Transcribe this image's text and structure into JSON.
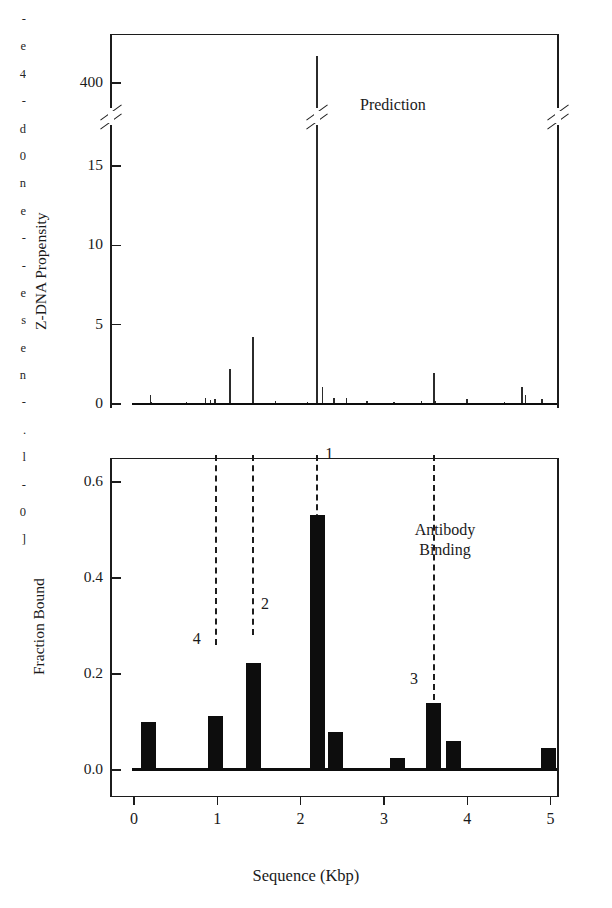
{
  "margin_text_fragments": [
    "-",
    "e",
    "4",
    "-",
    "d",
    "0",
    "n",
    "e",
    "-",
    "-",
    "e",
    "s",
    "e",
    "n",
    "-",
    ".",
    "l",
    "-",
    "0",
    "]"
  ],
  "figure": {
    "top_panel": {
      "annotation": "Prediction",
      "ylabel": "Z-DNA Propensity",
      "ytick_labels": [
        "0",
        "5",
        "10",
        "15",
        "400"
      ]
    },
    "bottom_panel": {
      "annotation_line1": "Antibody",
      "annotation_line2": "Binding",
      "ylabel": "Fraction Bound",
      "ytick_labels": [
        "0.0",
        "0.2",
        "0.4",
        "0.6"
      ]
    },
    "xaxis": {
      "title": "Sequence (Kbp)",
      "tick_labels": [
        "0",
        "1",
        "2",
        "3",
        "4",
        "5"
      ]
    },
    "peak_labels": [
      "1",
      "2",
      "3",
      "4"
    ],
    "colors": {
      "axis": "#1c1c1c",
      "bar_fill": "#0d0d0d",
      "spike": "#2b2b2b",
      "background": "#ffffff",
      "connector": "#1c1c1c"
    }
  },
  "chart_data": [
    {
      "type": "bar",
      "panel": "top",
      "title": "Prediction",
      "xlabel": "Sequence (Kbp)",
      "ylabel": "Z-DNA Propensity",
      "xlim": [
        -0.2,
        5.25
      ],
      "ylim": [
        0,
        17
      ],
      "yticks": [
        0,
        5,
        10,
        15,
        400
      ],
      "xticks": [
        0,
        1,
        2,
        3,
        4,
        5
      ],
      "axis_break": {
        "below": 15,
        "above": 400,
        "note": "y-axis broken between 15 and 400"
      },
      "grid": false,
      "legend": null,
      "x": [
        0.2,
        0.21,
        0.63,
        0.86,
        0.92,
        0.97,
        1.15,
        1.43,
        1.7,
        2.08,
        2.2,
        2.26,
        2.4,
        2.55,
        2.8,
        3.12,
        3.45,
        3.6,
        3.62,
        4.0,
        4.45,
        4.66,
        4.7,
        4.9
      ],
      "values": [
        0.55,
        0.15,
        0.1,
        0.35,
        0.28,
        0.3,
        2.2,
        4.2,
        0.18,
        0.12,
        425,
        1.05,
        0.35,
        0.4,
        0.22,
        0.12,
        0.18,
        1.95,
        0.2,
        0.3,
        0.12,
        1.05,
        0.55,
        0.3
      ],
      "annotations": [
        {
          "text": "Prediction",
          "x": 3.1,
          "y": 400
        }
      ]
    },
    {
      "type": "bar",
      "panel": "bottom",
      "title": "Antibody Binding",
      "xlabel": "Sequence (Kbp)",
      "ylabel": "Fraction Bound",
      "xlim": [
        -0.2,
        5.25
      ],
      "ylim": [
        0,
        0.67
      ],
      "yticks": [
        0.0,
        0.2,
        0.4,
        0.6
      ],
      "xticks": [
        0,
        1,
        2,
        3,
        4,
        5
      ],
      "grid": false,
      "legend": null,
      "bar_width_kbp": 0.18,
      "x": [
        0.17,
        0.98,
        1.43,
        2.2,
        2.42,
        3.16,
        3.6,
        3.83,
        4.98
      ],
      "values": [
        0.1,
        0.113,
        0.222,
        0.532,
        0.08,
        0.025,
        0.14,
        0.06,
        0.045
      ],
      "annotations": [
        {
          "text": "Antibody",
          "x": 3.4,
          "y": 0.5
        },
        {
          "text": "Binding",
          "x": 3.4,
          "y": 0.455
        }
      ],
      "markers": [
        {
          "label": "1",
          "x": 2.2
        },
        {
          "label": "2",
          "x": 1.43
        },
        {
          "label": "3",
          "x": 3.6
        },
        {
          "label": "4",
          "x": 0.98
        }
      ]
    }
  ]
}
